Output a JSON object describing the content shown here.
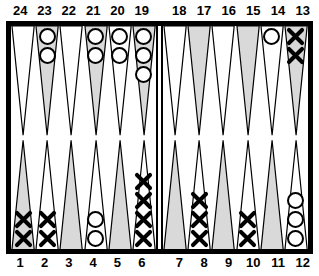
{
  "board": {
    "title": "Backgammon board position",
    "colors": {
      "frame": "#000000",
      "surface": "#ffffff",
      "point_shaded": "#d9d9d9",
      "point_plain": "#ffffff",
      "checker_outline": "#000000"
    },
    "top_labels": [
      "24",
      "23",
      "22",
      "21",
      "20",
      "19",
      "18",
      "17",
      "16",
      "15",
      "14",
      "13"
    ],
    "bottom_labels": [
      "1",
      "2",
      "3",
      "4",
      "5",
      "6",
      "7",
      "8",
      "9",
      "10",
      "11",
      "12"
    ],
    "points": [
      {
        "number": "24",
        "quadrant": "top-left",
        "shaded": false,
        "checker": null,
        "count": 0
      },
      {
        "number": "23",
        "quadrant": "top-left",
        "shaded": true,
        "checker": "O",
        "count": 2
      },
      {
        "number": "22",
        "quadrant": "top-left",
        "shaded": false,
        "checker": null,
        "count": 0
      },
      {
        "number": "21",
        "quadrant": "top-left",
        "shaded": true,
        "checker": "O",
        "count": 2
      },
      {
        "number": "20",
        "quadrant": "top-left",
        "shaded": false,
        "checker": "O",
        "count": 2
      },
      {
        "number": "19",
        "quadrant": "top-left",
        "shaded": true,
        "checker": "O",
        "count": 3
      },
      {
        "number": "18",
        "quadrant": "top-right",
        "shaded": false,
        "checker": null,
        "count": 0
      },
      {
        "number": "17",
        "quadrant": "top-right",
        "shaded": true,
        "checker": null,
        "count": 0
      },
      {
        "number": "16",
        "quadrant": "top-right",
        "shaded": false,
        "checker": null,
        "count": 0
      },
      {
        "number": "15",
        "quadrant": "top-right",
        "shaded": true,
        "checker": null,
        "count": 0
      },
      {
        "number": "14",
        "quadrant": "top-right",
        "shaded": false,
        "checker": "O",
        "count": 1
      },
      {
        "number": "13",
        "quadrant": "top-right",
        "shaded": true,
        "checker": "X",
        "count": 2
      },
      {
        "number": "1",
        "quadrant": "bottom-left",
        "shaded": true,
        "checker": "X",
        "count": 2
      },
      {
        "number": "2",
        "quadrant": "bottom-left",
        "shaded": false,
        "checker": "X",
        "count": 2
      },
      {
        "number": "3",
        "quadrant": "bottom-left",
        "shaded": true,
        "checker": null,
        "count": 0
      },
      {
        "number": "4",
        "quadrant": "bottom-left",
        "shaded": false,
        "checker": "O",
        "count": 2
      },
      {
        "number": "5",
        "quadrant": "bottom-left",
        "shaded": true,
        "checker": null,
        "count": 0
      },
      {
        "number": "6",
        "quadrant": "bottom-left",
        "shaded": false,
        "checker": "X",
        "count": 4
      },
      {
        "number": "7",
        "quadrant": "bottom-right",
        "shaded": true,
        "checker": null,
        "count": 0
      },
      {
        "number": "8",
        "quadrant": "bottom-right",
        "shaded": false,
        "checker": "X",
        "count": 3
      },
      {
        "number": "9",
        "quadrant": "bottom-right",
        "shaded": true,
        "checker": null,
        "count": 0
      },
      {
        "number": "10",
        "quadrant": "bottom-right",
        "shaded": false,
        "checker": "X",
        "count": 2
      },
      {
        "number": "11",
        "quadrant": "bottom-right",
        "shaded": true,
        "checker": null,
        "count": 0
      },
      {
        "number": "12",
        "quadrant": "bottom-right",
        "shaded": false,
        "checker": "O",
        "count": 3
      }
    ],
    "bar": {
      "checkers_o": 0,
      "checkers_x": 0
    }
  }
}
